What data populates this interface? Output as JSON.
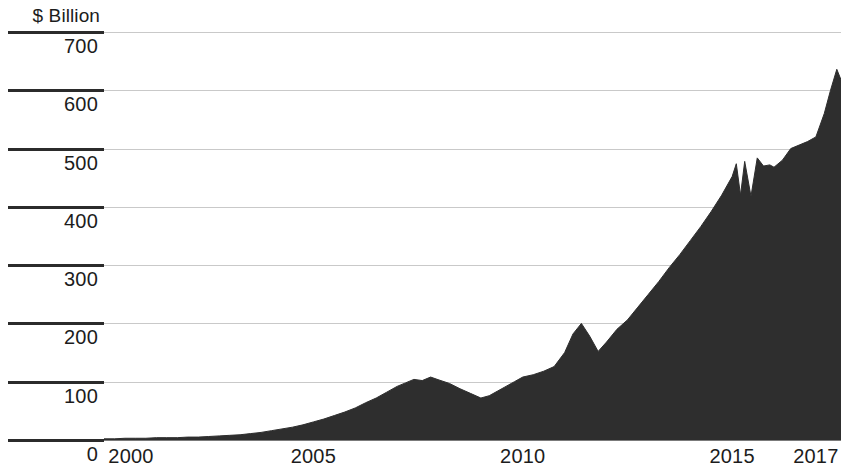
{
  "chart_data": {
    "type": "area",
    "title": "",
    "subtitle": "",
    "xlabel": "",
    "ylabel": "$ Billion",
    "unit_caption": "$ Billion",
    "grid": true,
    "legend": false,
    "legend_position": "none",
    "series_color": "#2e2e2e",
    "background_color": "#ffffff",
    "gridline_color": "#c9c9c9",
    "axis_color": "#2b2b2b",
    "xlim": [
      2000,
      2017.6
    ],
    "ylim": [
      0,
      700
    ],
    "ytick_values": [
      0,
      100,
      200,
      300,
      400,
      500,
      600,
      700
    ],
    "ytick_labels": [
      "0",
      "100",
      "200",
      "300",
      "400",
      "500",
      "600",
      "700"
    ],
    "xtick_values": [
      2000,
      2005,
      2010,
      2015,
      2017
    ],
    "xtick_labels": [
      "2000",
      "2005",
      "2010",
      "2015",
      "2017"
    ],
    "series": [
      {
        "name": "Value",
        "x": [
          2000.0,
          2000.25,
          2000.5,
          2000.75,
          2001.0,
          2001.25,
          2001.5,
          2001.75,
          2002.0,
          2002.25,
          2002.5,
          2002.75,
          2003.0,
          2003.25,
          2003.5,
          2003.75,
          2004.0,
          2004.25,
          2004.5,
          2004.75,
          2005.0,
          2005.25,
          2005.5,
          2005.75,
          2006.0,
          2006.25,
          2006.5,
          2006.75,
          2007.0,
          2007.2,
          2007.4,
          2007.6,
          2007.8,
          2008.0,
          2008.25,
          2008.5,
          2008.75,
          2009.0,
          2009.2,
          2009.4,
          2009.6,
          2009.8,
          2010.0,
          2010.25,
          2010.5,
          2010.75,
          2011.0,
          2011.2,
          2011.4,
          2011.6,
          2011.8,
          2012.0,
          2012.25,
          2012.5,
          2012.75,
          2013.0,
          2013.25,
          2013.5,
          2013.75,
          2014.0,
          2014.25,
          2014.5,
          2014.75,
          2015.0,
          2015.1,
          2015.2,
          2015.3,
          2015.45,
          2015.6,
          2015.75,
          2015.9,
          2016.0,
          2016.2,
          2016.4,
          2016.6,
          2016.8,
          2017.0,
          2017.2,
          2017.35,
          2017.5,
          2017.6
        ],
        "values": [
          2,
          2,
          3,
          3,
          3,
          4,
          4,
          4,
          5,
          5,
          6,
          7,
          8,
          9,
          11,
          13,
          16,
          19,
          22,
          26,
          31,
          36,
          42,
          48,
          55,
          64,
          72,
          82,
          92,
          98,
          104,
          102,
          108,
          103,
          97,
          88,
          80,
          72,
          76,
          84,
          92,
          100,
          108,
          112,
          118,
          126,
          150,
          182,
          200,
          178,
          152,
          168,
          190,
          206,
          228,
          250,
          272,
          296,
          318,
          342,
          366,
          392,
          420,
          452,
          474,
          420,
          478,
          418,
          484,
          470,
          472,
          468,
          480,
          500,
          506,
          512,
          520,
          560,
          600,
          636,
          618
        ]
      }
    ]
  }
}
